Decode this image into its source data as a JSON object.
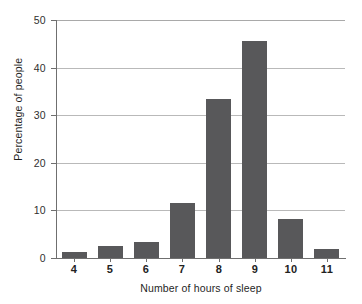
{
  "chart_data": {
    "type": "bar",
    "title": "",
    "xlabel": "Number of hours of sleep",
    "ylabel": "Percentage of people",
    "categories": [
      "4",
      "5",
      "6",
      "7",
      "8",
      "9",
      "10",
      "11"
    ],
    "values": [
      1.2,
      2.5,
      3.4,
      11.5,
      33.4,
      45.6,
      8.1,
      1.8
    ],
    "series": [
      {
        "name": "Percentage of people",
        "values": [
          1.2,
          2.5,
          3.4,
          11.5,
          33.4,
          45.6,
          8.1,
          1.8
        ]
      }
    ],
    "ylim": [
      0,
      50
    ],
    "yticks": [
      0,
      10,
      20,
      30,
      40,
      50
    ],
    "ytick_labels": [
      "0",
      "10",
      "20",
      "30",
      "40",
      "50"
    ],
    "xtick_labels": [
      "4",
      "5",
      "6",
      "7",
      "8",
      "9",
      "10",
      "11"
    ],
    "grid": true,
    "grid_axis": "y",
    "legend": false,
    "legend_position": "none",
    "bar_color": "#58585a",
    "grid_color": "#b9b9b9",
    "axis_color": "#6f6f6f",
    "background_color": "#ffffff"
  }
}
